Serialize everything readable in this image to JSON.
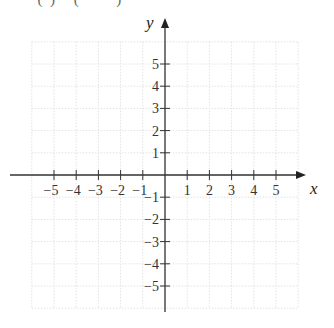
{
  "header_fragment": "          (  )     (          )",
  "diagram": {
    "type": "coordinate-plane",
    "x_axis": {
      "label": "x",
      "min": -5,
      "max": 5,
      "ticks": [
        "−5",
        "−4",
        "−3",
        "−2",
        "−1",
        "1",
        "2",
        "3",
        "4",
        "5"
      ]
    },
    "y_axis": {
      "label": "y",
      "min": -5,
      "max": 5,
      "ticks": [
        "5",
        "4",
        "3",
        "2",
        "1",
        "−1",
        "−2",
        "−3",
        "−4",
        "−5"
      ]
    },
    "grid": {
      "visible": true,
      "style": "dotted",
      "color": "#e4e4e4",
      "range": [
        -6,
        6
      ]
    },
    "colors": {
      "axis": "#333333",
      "grid": "#e4e4e4",
      "background": "#ffffff"
    }
  }
}
